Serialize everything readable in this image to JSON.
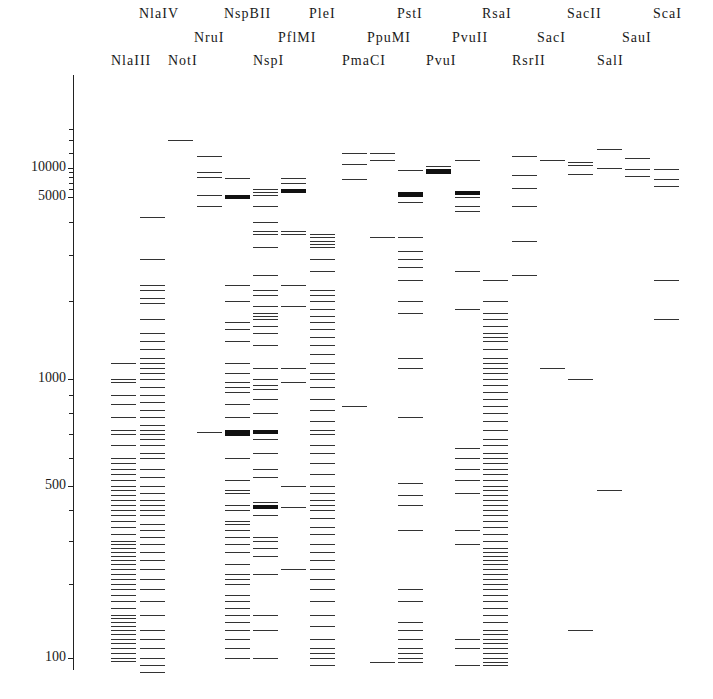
{
  "chart_data": {
    "type": "gel-band-plot",
    "title": "",
    "xlabel": "",
    "ylabel": "",
    "yscale": "log (fragment size, bp)",
    "ylim": [
      90,
      20000
    ],
    "yticks": [
      100,
      500,
      1000,
      5000,
      10000
    ],
    "ytick_labels": [
      "100",
      "500",
      "1000",
      "5000",
      "10000"
    ],
    "grid": false,
    "legend": "none",
    "lanes": [
      {
        "name": "NlaIII",
        "label_row": 2,
        "x": 111,
        "bands": [
          1150,
          1000,
          980,
          900,
          850,
          780,
          720,
          700,
          650,
          600,
          580,
          560,
          540,
          520,
          500,
          480,
          460,
          440,
          420,
          400,
          380,
          360,
          340,
          320,
          300,
          290,
          280,
          270,
          260,
          250,
          240,
          230,
          220,
          210,
          200,
          190,
          180,
          170,
          160,
          150,
          145,
          140,
          135,
          130,
          125,
          120,
          115,
          110,
          105,
          100,
          98
        ]
      },
      {
        "name": "NlaIV",
        "label_row": 0,
        "x": 140,
        "bands": [
          4200,
          2900,
          2300,
          2200,
          2050,
          1950,
          1700,
          1500,
          1400,
          1300,
          1200,
          1150,
          1100,
          1050,
          1000,
          950,
          900,
          860,
          820,
          780,
          740,
          720,
          700,
          680,
          650,
          620,
          600,
          560,
          530,
          500,
          470,
          440,
          420,
          400,
          380,
          350,
          330,
          310,
          290,
          270,
          250,
          230,
          210,
          190,
          170,
          150,
          130,
          120,
          110,
          100,
          95,
          90
        ]
      },
      {
        "name": "NotI",
        "label_row": 2,
        "x": 168,
        "bands": [
          14000
        ]
      },
      {
        "name": "NruI",
        "label_row": 1,
        "x": 197,
        "bands": [
          11500,
          9000,
          8000,
          5200,
          4600,
          710
        ]
      },
      {
        "name": "NspBII",
        "label_row": 0,
        "x": 225,
        "bands": [
          7800,
          5200,
          5000,
          2300,
          2000,
          1650,
          1550,
          1400,
          1150,
          1050,
          980,
          950,
          920,
          850,
          780,
          720,
          710,
          700,
          600,
          520,
          480,
          470,
          420,
          400,
          360,
          350,
          330,
          310,
          290,
          270,
          240,
          220,
          210,
          200,
          180,
          170,
          160,
          150,
          140,
          130,
          120,
          110,
          100
        ]
      },
      {
        "name": "NspI",
        "label_row": 2,
        "x": 253,
        "bands": [
          6000,
          5600,
          5200,
          4600,
          4000,
          3700,
          3600,
          3200,
          2500,
          2200,
          2100,
          1900,
          1800,
          1750,
          1700,
          1600,
          1500,
          1350,
          1100,
          1000,
          960,
          940,
          880,
          800,
          720,
          710,
          680,
          620,
          560,
          530,
          430,
          420,
          410,
          380,
          310,
          300,
          280,
          260,
          220,
          150,
          130,
          100
        ]
      },
      {
        "name": "PflMI",
        "label_row": 1,
        "x": 281,
        "bands": [
          7800,
          7000,
          6000,
          5800,
          3700,
          3600,
          2300,
          1900,
          1100,
          980,
          500,
          410,
          230
        ]
      },
      {
        "name": "PleI",
        "label_row": 0,
        "x": 310,
        "bands": [
          3600,
          3500,
          3400,
          3300,
          3200,
          2900,
          2600,
          2200,
          2100,
          2000,
          1850,
          1750,
          1650,
          1550,
          1450,
          1350,
          1250,
          1150,
          1050,
          1000,
          950,
          880,
          820,
          760,
          720,
          700,
          650,
          620,
          580,
          540,
          500,
          470,
          440,
          420,
          400,
          370,
          340,
          320,
          290,
          270,
          250,
          230,
          210,
          190,
          170,
          150,
          135,
          120,
          110,
          105,
          100,
          95
        ]
      },
      {
        "name": "PmaCI",
        "label_row": 2,
        "x": 342,
        "bands": [
          12000,
          10500,
          7600,
          840
        ]
      },
      {
        "name": "PpuMI",
        "label_row": 1,
        "x": 370,
        "bands": [
          12000,
          11000,
          3500,
          97
        ]
      },
      {
        "name": "PstI",
        "label_row": 0,
        "x": 398,
        "bands": [
          9500,
          5600,
          5400,
          5200,
          4800,
          3500,
          3100,
          2900,
          2700,
          2400,
          2000,
          1800,
          1200,
          1100,
          780,
          510,
          460,
          420,
          330,
          190,
          170,
          140,
          130,
          120,
          110,
          105,
          100,
          97
        ]
      },
      {
        "name": "PvuI",
        "label_row": 2,
        "x": 426,
        "bands": [
          10200,
          9800,
          9500,
          9300,
          9000
        ]
      },
      {
        "name": "PvuII",
        "label_row": 1,
        "x": 455,
        "bands": [
          11000,
          5800,
          5600,
          5500,
          5000,
          4600,
          4400,
          2600,
          1850,
          640,
          600,
          560,
          520,
          470,
          330,
          290,
          120,
          110,
          95
        ]
      },
      {
        "name": "RsaI",
        "label_row": 0,
        "x": 483,
        "bands": [
          2400,
          2000,
          1800,
          1700,
          1600,
          1500,
          1450,
          1400,
          1300,
          1200,
          1150,
          1100,
          1050,
          1000,
          960,
          920,
          880,
          840,
          800,
          760,
          720,
          680,
          650,
          620,
          600,
          580,
          560,
          540,
          520,
          500,
          480,
          460,
          440,
          420,
          400,
          380,
          360,
          340,
          320,
          300,
          280,
          270,
          260,
          250,
          240,
          230,
          220,
          210,
          200,
          190,
          180,
          170,
          160,
          150,
          140,
          130,
          125,
          120,
          115,
          110,
          105,
          100,
          97,
          95
        ]
      },
      {
        "name": "RsrII",
        "label_row": 2,
        "x": 512,
        "bands": [
          11500,
          8500,
          6200,
          4600,
          3400,
          2500
        ]
      },
      {
        "name": "SacI",
        "label_row": 1,
        "x": 540,
        "bands": [
          11000,
          1100
        ]
      },
      {
        "name": "SacII",
        "label_row": 0,
        "x": 568,
        "bands": [
          10800,
          10400,
          8700,
          1000,
          130
        ]
      },
      {
        "name": "SalI",
        "label_row": 2,
        "x": 597,
        "bands": [
          12500,
          9900,
          480
        ]
      },
      {
        "name": "SauI",
        "label_row": 1,
        "x": 625,
        "bands": [
          11300,
          9700,
          8300
        ]
      },
      {
        "name": "ScaI",
        "label_row": 0,
        "x": 654,
        "bands": [
          9800,
          7700,
          6500,
          2400,
          1700
        ]
      }
    ]
  },
  "axis": {
    "tick_labels": [
      {
        "value": 10000,
        "label": "10000"
      },
      {
        "value": 5000,
        "label": "5000"
      },
      {
        "value": 1000,
        "label": "1000"
      },
      {
        "value": 500,
        "label": "500"
      },
      {
        "value": 100,
        "label": "100"
      }
    ]
  }
}
